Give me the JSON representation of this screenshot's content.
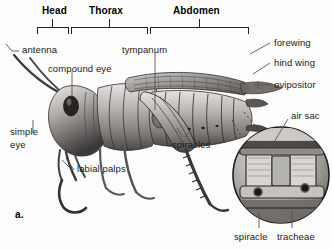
{
  "figure": {
    "panel_label": "a.",
    "background_color": "#fdfdfd",
    "text_color": "#1a1a1a",
    "leader_color": "#555555",
    "bracket_color": "#222222"
  },
  "body_regions": [
    {
      "label": "Head",
      "bracket_x1": 37,
      "bracket_x2": 68,
      "tick_x": 52,
      "label_x": 42,
      "label_y": 8
    },
    {
      "label": "Thorax",
      "bracket_x1": 71,
      "bracket_x2": 147,
      "tick_x": 109,
      "label_x": 90,
      "label_y": 8
    },
    {
      "label": "Abdomen",
      "bracket_x1": 150,
      "bracket_x2": 248,
      "tick_x": 199,
      "label_x": 174,
      "label_y": 8
    }
  ],
  "callouts_left": [
    {
      "name": "antenna",
      "text": "antenna",
      "x": 22,
      "y": 47
    },
    {
      "name": "compound-eye",
      "text": "compound eye",
      "x": 48,
      "y": 67
    },
    {
      "name": "simple-eye",
      "text": "simple",
      "text2": "eye",
      "x": 10,
      "y": 128
    },
    {
      "name": "labial-palps",
      "text": "labial palps",
      "x": 75,
      "y": 166
    }
  ],
  "callouts_center": [
    {
      "name": "tympanum",
      "text": "tympanum",
      "x": 122,
      "y": 47
    },
    {
      "name": "spiracles",
      "text": "spiracles",
      "x": 172,
      "y": 143
    }
  ],
  "callouts_right": [
    {
      "name": "forewing",
      "text": "forewing",
      "x": 274,
      "y": 46
    },
    {
      "name": "hind-wing",
      "text": "hind wing",
      "x": 274,
      "y": 66
    },
    {
      "name": "ovipositor",
      "text": "ovipositor",
      "x": 274,
      "y": 88
    },
    {
      "name": "air-sac",
      "text": "air sac",
      "x": 291,
      "y": 113
    }
  ],
  "inset": {
    "name": "tracheal-system-detail",
    "center_x": 281,
    "center_y": 175,
    "radius": 48,
    "callouts": [
      {
        "name": "spiracle",
        "text": "spiracle",
        "x": 235,
        "y": 232,
        "line_x": 259,
        "line_y1": 212,
        "line_y2": 230
      },
      {
        "name": "tracheae",
        "text": "tracheae",
        "x": 278,
        "y": 232,
        "line_x": 292,
        "line_y1": 206,
        "line_y2": 230
      }
    ]
  }
}
